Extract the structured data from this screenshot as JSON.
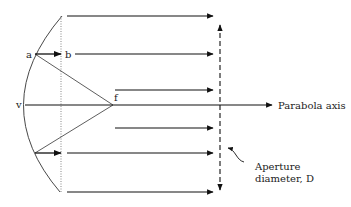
{
  "diagram": {
    "labels": {
      "point_a": "a",
      "point_b": "b",
      "vertex": "v",
      "focus": "f",
      "axis": "Parabola axis",
      "aperture_line1": "Aperture",
      "aperture_line2": "diameter, D"
    },
    "colors": {
      "stroke": "#111111",
      "background": "#ffffff"
    },
    "rays_y": [
      16,
      54,
      90,
      128,
      158,
      192
    ],
    "elements": [
      "parabola-curve",
      "aperture-plane-dotted-line",
      "parallel-reflected-rays",
      "focal-rays-from-f",
      "parabola-axis-arrow",
      "aperture-diameter-dashed-arrow",
      "aperture-callout-curve"
    ]
  }
}
